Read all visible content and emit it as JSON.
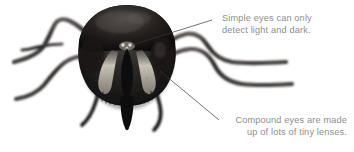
{
  "figure": {
    "background_color": "#ffffff",
    "body_color": "#1e1e1e",
    "highlight_color": "#cfcac2"
  },
  "annotations": [
    {
      "id": "simple-eyes",
      "line1": "Simple eyes can only",
      "line2": "detect light and dark.",
      "text_color": "#8e8e8e",
      "align": "left",
      "leader_from": [
        212,
        20
      ],
      "leader_to": [
        132,
        44
      ]
    },
    {
      "id": "compound-eyes",
      "line1": "Compound eyes are made",
      "line2": "up of lots of tiny lenses.",
      "text_color": "#8e8e8e",
      "align": "right",
      "leader_from": [
        219,
        120
      ],
      "leader_to": [
        160,
        72
      ]
    }
  ],
  "leader_line": {
    "color": "#3a3a3a",
    "width": 0.7
  }
}
